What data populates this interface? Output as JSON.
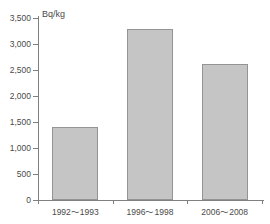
{
  "chart_data": {
    "type": "bar",
    "title": "",
    "subtitle": "",
    "unit_label": "Bq/kg",
    "xlabel": "",
    "ylabel": "Bq/kg",
    "categories": [
      "1992～1993",
      "1996～1998",
      "2006～2008"
    ],
    "values": [
      1410,
      3280,
      2620
    ],
    "ylim": [
      0,
      3500
    ],
    "ytick_values": [
      0,
      500,
      1000,
      1500,
      2000,
      2500,
      3000,
      3500
    ],
    "ytick_labels": [
      "0",
      "500",
      "1,000",
      "1,500",
      "2,000",
      "2,500",
      "3,000",
      "3,500"
    ],
    "grid": false,
    "legend": false,
    "legend_position": "none",
    "bar_fill_color": "#c5c5c5",
    "bar_border_color": "#949494",
    "axis_color": "#808080",
    "text_color": "#4a4a4a",
    "background_color": "#ffffff"
  }
}
